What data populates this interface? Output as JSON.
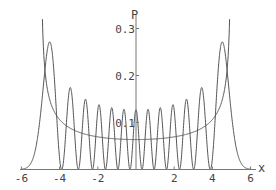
{
  "chart_data": {
    "type": "line",
    "title": "",
    "xlabel": "x",
    "ylabel": "P",
    "xlim": [
      -6,
      6
    ],
    "ylim": [
      0,
      0.32
    ],
    "x_ticks": [
      -6,
      -4,
      -2,
      2,
      4,
      6
    ],
    "x_tick_labels": [
      "-6",
      "-4",
      "-2",
      "2",
      "4",
      "6"
    ],
    "y_ticks": [
      0.1,
      0.2,
      0.3
    ],
    "y_tick_labels": [
      "0.1",
      "0.2",
      "0.3"
    ],
    "grid": false,
    "legend": null,
    "series": [
      {
        "name": "quantum probability density |psi_12(x)|^2",
        "quantum_number": 12,
        "peak_count": 13,
        "peak_x": [
          -4.6,
          -3.5,
          -2.7,
          -2.0,
          -1.3,
          -0.65,
          0,
          0.65,
          1.3,
          2.0,
          2.7,
          3.5,
          4.6
        ],
        "peak_y": [
          0.27,
          0.174,
          0.149,
          0.136,
          0.132,
          0.128,
          0.127,
          0.128,
          0.132,
          0.136,
          0.149,
          0.174,
          0.27
        ]
      },
      {
        "name": "classical probability density 1/(pi*sqrt(25 - x^2))",
        "turning_points": [
          -5,
          5
        ],
        "min_value_at_x0": 0.0637
      }
    ]
  },
  "axes": {
    "x_label": "x",
    "y_label": "P",
    "x_tick_labels": [
      "-6",
      "-4",
      "-2",
      "2",
      "4",
      "6"
    ],
    "y_tick_labels": [
      "0.1",
      "0.2",
      "0.3"
    ]
  }
}
